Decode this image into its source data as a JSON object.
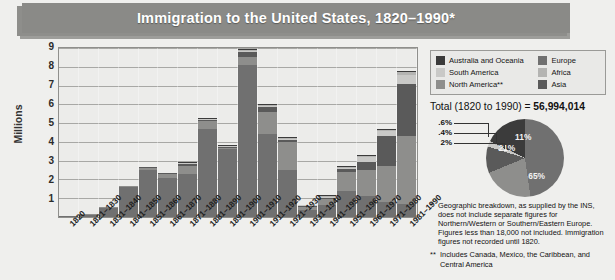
{
  "title": "Immigration to the United States, 1820–1990*",
  "axis": {
    "ylabel": "Millions",
    "yticks": [
      "9",
      "8",
      "7",
      "6",
      "5",
      "4",
      "3",
      "2",
      "1"
    ]
  },
  "legend": {
    "left_items": [
      {
        "label": "Australia and Oceania",
        "color": "#3b3b3b"
      },
      {
        "label": "South America",
        "color": "#c9c9c7"
      },
      {
        "label": "North America**",
        "color": "#8e8e8c"
      }
    ],
    "right_items": [
      {
        "label": "Europe",
        "color": "#707070"
      },
      {
        "label": "Africa",
        "color": "#b4b4b2"
      },
      {
        "label": "Asia",
        "color": "#5a5a5a"
      }
    ]
  },
  "total": {
    "prefix": "Total (1820 to 1990) = ",
    "value": "56,994,014"
  },
  "notes": {
    "star": "*",
    "note1": "Geographic breakdown, as supplied by the INS, does not include separate figures for Northern/Western or Southern/Eastern Europe. Figures less than 18,000 not included. Immigration figures not recorded until 1820.",
    "star2": "**",
    "note2": "Includes Canada, Mexico, the Caribbean, and Central America"
  },
  "chart_data": {
    "type": "bar",
    "title": "Immigration to the United States, 1820–1990*",
    "xlabel": "",
    "ylabel": "Millions",
    "ylim": [
      0,
      9
    ],
    "grid": true,
    "stacked": true,
    "legend_position": "top-right",
    "categories": [
      "1820",
      "1821–1830",
      "1831–1840",
      "1841–1850",
      "1851–1860",
      "1861–1870",
      "1871–1880",
      "1881–1890",
      "1891–1900",
      "1901–1910",
      "1911–1920",
      "1921–1930",
      "1931–1940",
      "1941–1950",
      "1951–1960",
      "1961–1970",
      "1971–1980",
      "1981–1990"
    ],
    "series": [
      {
        "name": "Europe",
        "color": "#707070",
        "values": [
          0.01,
          0.1,
          0.5,
          1.6,
          2.5,
          2.1,
          2.3,
          4.7,
          3.6,
          8.1,
          4.4,
          2.5,
          0.35,
          0.62,
          1.4,
          1.1,
          0.8,
          0.7
        ]
      },
      {
        "name": "North America**",
        "color": "#8e8e8c",
        "values": [
          0.0,
          0.01,
          0.02,
          0.06,
          0.12,
          0.17,
          0.4,
          0.43,
          0.04,
          0.4,
          1.2,
          1.5,
          0.16,
          0.35,
          1.0,
          1.4,
          1.9,
          3.6
        ]
      },
      {
        "name": "Asia",
        "color": "#5a5a5a",
        "values": [
          0.0,
          0.0,
          0.0,
          0.0,
          0.04,
          0.06,
          0.12,
          0.06,
          0.07,
          0.3,
          0.25,
          0.11,
          0.02,
          0.03,
          0.15,
          0.43,
          1.6,
          2.8
        ]
      },
      {
        "name": "South America",
        "color": "#c9c9c7",
        "values": [
          0.0,
          0.0,
          0.0,
          0.0,
          0.0,
          0.0,
          0.01,
          0.01,
          0.01,
          0.02,
          0.04,
          0.04,
          0.01,
          0.02,
          0.08,
          0.25,
          0.28,
          0.46
        ]
      },
      {
        "name": "Africa",
        "color": "#b4b4b2",
        "values": [
          0.0,
          0.0,
          0.0,
          0.0,
          0.0,
          0.0,
          0.0,
          0.0,
          0.0,
          0.01,
          0.01,
          0.01,
          0.0,
          0.01,
          0.01,
          0.03,
          0.08,
          0.18
        ]
      },
      {
        "name": "Australia and Oceania",
        "color": "#3b3b3b",
        "values": [
          0.0,
          0.0,
          0.0,
          0.0,
          0.0,
          0.0,
          0.01,
          0.01,
          0.01,
          0.01,
          0.01,
          0.01,
          0.0,
          0.01,
          0.01,
          0.03,
          0.04,
          0.04
        ]
      }
    ]
  },
  "pie_data": {
    "type": "pie",
    "title": "Geographic breakdown",
    "slices": [
      {
        "label": "65%",
        "value": 65,
        "color": "#707070",
        "name": "Europe"
      },
      {
        "label": "21%",
        "value": 21,
        "color": "#8e8e8c",
        "name": "North America**"
      },
      {
        "label": "11%",
        "value": 11,
        "color": "#5a5a5a",
        "name": "Asia"
      },
      {
        "label": "2%",
        "value": 2,
        "color": "#c9c9c7",
        "name": "South America"
      },
      {
        "label": ".4%",
        "value": 0.4,
        "color": "#b4b4b2",
        "name": "Africa"
      },
      {
        "label": ".6%",
        "value": 0.6,
        "color": "#3b3b3b",
        "name": "Australia and Oceania"
      }
    ],
    "callouts": [
      " .6%",
      ".4%",
      "2%"
    ]
  },
  "colors": {
    "banner": "#8a8a87",
    "page_bg": "#efefed",
    "plot_bg": "#ececea"
  }
}
